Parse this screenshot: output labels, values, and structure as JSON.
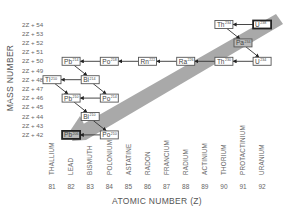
{
  "diagram": {
    "y_axis_title": "MASS NUMBER",
    "x_axis_title": "ATOMIC NUMBER (Z)",
    "y_ticks": [
      "2Z + 54",
      "2Z + 53",
      "2Z + 52",
      "2Z + 51",
      "2Z + 50",
      "2Z + 49",
      "2Z + 48",
      "2Z + 47",
      "2Z + 46",
      "2Z + 45",
      "2Z + 44",
      "2Z + 43",
      "2Z + 42"
    ],
    "x_ticks": [
      {
        "z": "81",
        "element": "THALLIUM"
      },
      {
        "z": "82",
        "element": "LEAD"
      },
      {
        "z": "83",
        "element": "BISMUTH"
      },
      {
        "z": "84",
        "element": "POLONIUM"
      },
      {
        "z": "85",
        "element": "ASTATINE"
      },
      {
        "z": "86",
        "element": "RADON"
      },
      {
        "z": "87",
        "element": "FRANCIUM"
      },
      {
        "z": "88",
        "element": "RADIUM"
      },
      {
        "z": "89",
        "element": "ACTINIUM"
      },
      {
        "z": "90",
        "element": "THORIUM"
      },
      {
        "z": "91",
        "element": "PROTACTINIUM"
      },
      {
        "z": "92",
        "element": "URANIUM"
      }
    ],
    "band_color": "#a9a9a9",
    "nodes": [
      {
        "id": "U238",
        "symbol": "U",
        "mass": "238",
        "z": 92,
        "k": 54,
        "style": "bold"
      },
      {
        "id": "Th234",
        "symbol": "Th",
        "mass": "234",
        "z": 90,
        "k": 54,
        "style": "normal"
      },
      {
        "id": "Pa234",
        "symbol": "Pa",
        "mass": "234",
        "z": 91,
        "k": 52,
        "style": "shaded"
      },
      {
        "id": "U234",
        "symbol": "U",
        "mass": "234",
        "z": 92,
        "k": 50,
        "style": "normal"
      },
      {
        "id": "Th230",
        "symbol": "Th",
        "mass": "230",
        "z": 90,
        "k": 50,
        "style": "normal"
      },
      {
        "id": "Ra226",
        "symbol": "Ra",
        "mass": "226",
        "z": 88,
        "k": 50,
        "style": "normal"
      },
      {
        "id": "Rn222",
        "symbol": "Rn",
        "mass": "222",
        "z": 86,
        "k": 50,
        "style": "normal"
      },
      {
        "id": "Po218",
        "symbol": "Po",
        "mass": "218",
        "z": 84,
        "k": 50,
        "style": "normal"
      },
      {
        "id": "Pb214",
        "symbol": "Pb",
        "mass": "214",
        "z": 82,
        "k": 50,
        "style": "normal"
      },
      {
        "id": "Bi214",
        "symbol": "Bi",
        "mass": "214",
        "z": 83,
        "k": 48,
        "style": "normal"
      },
      {
        "id": "Tl210",
        "symbol": "Tl",
        "mass": "210",
        "z": 81,
        "k": 48,
        "style": "normal"
      },
      {
        "id": "Po214",
        "symbol": "Po",
        "mass": "214",
        "z": 84,
        "k": 46,
        "style": "normal"
      },
      {
        "id": "Pb210",
        "symbol": "Pb",
        "mass": "210",
        "z": 82,
        "k": 46,
        "style": "normal"
      },
      {
        "id": "Bi210",
        "symbol": "Bi",
        "mass": "210",
        "z": 83,
        "k": 44,
        "style": "normal"
      },
      {
        "id": "Po210",
        "symbol": "Po",
        "mass": "210",
        "z": 84,
        "k": 42,
        "style": "normal"
      },
      {
        "id": "Pb206",
        "symbol": "Pb",
        "mass": "206",
        "z": 82,
        "k": 42,
        "style": "bold"
      }
    ],
    "edges": [
      {
        "from": "U238",
        "to": "Th234",
        "type": "alpha"
      },
      {
        "from": "Th234",
        "to": "Pa234",
        "type": "beta"
      },
      {
        "from": "Pa234",
        "to": "U234",
        "type": "beta"
      },
      {
        "from": "U234",
        "to": "Th230",
        "type": "alpha"
      },
      {
        "from": "Th230",
        "to": "Ra226",
        "type": "alpha"
      },
      {
        "from": "Ra226",
        "to": "Rn222",
        "type": "alpha"
      },
      {
        "from": "Rn222",
        "to": "Po218",
        "type": "alpha"
      },
      {
        "from": "Po218",
        "to": "Pb214",
        "type": "alpha"
      },
      {
        "from": "Pb214",
        "to": "Bi214",
        "type": "beta"
      },
      {
        "from": "Bi214",
        "to": "Tl210",
        "type": "alpha"
      },
      {
        "from": "Bi214",
        "to": "Po214",
        "type": "beta"
      },
      {
        "from": "Tl210",
        "to": "Pb210",
        "type": "beta"
      },
      {
        "from": "Po214",
        "to": "Pb210",
        "type": "alpha"
      },
      {
        "from": "Pb210",
        "to": "Bi210",
        "type": "beta"
      },
      {
        "from": "Bi210",
        "to": "Po210",
        "type": "beta"
      },
      {
        "from": "Po210",
        "to": "Pb206",
        "type": "alpha"
      }
    ]
  }
}
